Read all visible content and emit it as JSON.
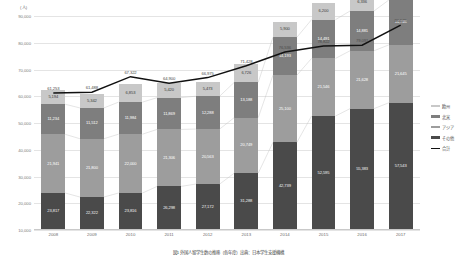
{
  "chart_data": {
    "type": "bar",
    "title": "",
    "unit_label": "(人)",
    "xlabel": "",
    "ylabel": "",
    "ylim": [
      10000,
      90000
    ],
    "ytick_values": [
      90000,
      80000,
      70000,
      60000,
      50000,
      40000,
      30000,
      20000,
      10000
    ],
    "ytick_labels": [
      "90,000",
      "80,000",
      "70,000",
      "60,000",
      "50,000",
      "40,000",
      "30,000",
      "20,000",
      "10,000"
    ],
    "grid": true,
    "legend_position": "right",
    "categories": [
      "2008",
      "2009",
      "2010",
      "2011",
      "2012",
      "2013",
      "2014",
      "2015",
      "2016",
      "2017"
    ],
    "series": [
      {
        "name": "その他",
        "color": "#4a4a4a",
        "values": [
          23817,
          22322,
          23816,
          26298,
          27172,
          31288,
          42739,
          52595,
          55383,
          57543
        ],
        "labels": [
          "23,817",
          "22,322",
          "23,816",
          "26,298",
          "27,172",
          "31,288",
          "42,739",
          "52,595",
          "55,383",
          "57,543"
        ]
      },
      {
        "name": "アジア",
        "color": "#9d9d9d",
        "values": [
          21941,
          21800,
          22000,
          21306,
          20563,
          20749,
          25100,
          21546,
          21628,
          21645
        ],
        "labels": [
          "21,941",
          "21,800",
          "22,000",
          "21,306",
          "20,563",
          "20,749",
          "25,100",
          "21,546",
          "21,628",
          "21,645"
        ]
      },
      {
        "name": "北米",
        "color": "#7e7e7e",
        "values": [
          11234,
          11512,
          11984,
          11869,
          12288,
          13188,
          14193,
          14491,
          14881,
          16748
        ],
        "labels": [
          "11,234",
          "11,512",
          "11,984",
          "11,869",
          "12,288",
          "13,188",
          "14,193",
          "14,491",
          "14,881",
          "16,748"
        ]
      },
      {
        "name": "欧州",
        "color": "#c8c8c8",
        "values": [
          5194,
          5342,
          6853,
          5420,
          5473,
          6726,
          5900,
          6200,
          6336,
          7433
        ],
        "labels": [
          "5,194",
          "5,342",
          "6,853",
          "5,420",
          "5,473",
          "6,726",
          "5,900",
          "6,200",
          "6,336",
          "7,433"
        ]
      }
    ],
    "line_series": {
      "name": "合計",
      "color": "#111111",
      "values": [
        61253,
        61488,
        67322,
        64900,
        66975,
        71428,
        76536,
        78822,
        79091,
        86575
      ],
      "labels": [
        "61,253",
        "61,488",
        "67,322",
        "64,900",
        "66,975",
        "71,428",
        "76,536",
        "78,822",
        "79,091",
        "86,575"
      ]
    },
    "caption": "図1 外国人留学生数の推移（各年度）出典：日本学生支援機構"
  }
}
